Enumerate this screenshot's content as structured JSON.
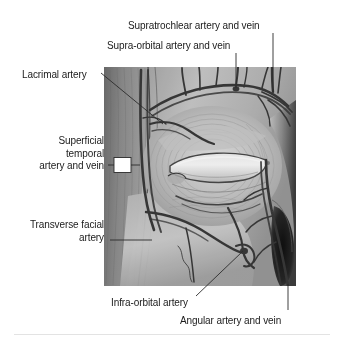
{
  "figure": {
    "view": "right lateral-oblique facial dissection",
    "style": "monochrome airbrush / wash medical illustration",
    "background_color": "#ffffff",
    "vessel_color": "#3a3a3a",
    "leader_color": "#2b2b2b",
    "text_color": "#1b1b1b",
    "image_bounds": {
      "left": 104,
      "top": 67,
      "right": 296,
      "bottom": 286
    }
  },
  "labels": [
    {
      "id": "supratrochlear",
      "text": "Supratrochlear artery and vein",
      "x": 128,
      "y": 20,
      "align": "left",
      "leader": {
        "type": "vertical",
        "from_x": 273,
        "from_y": 33,
        "to_x": 273,
        "to_y": 92
      }
    },
    {
      "id": "supra-orbital",
      "text": "Supra-orbital artery and vein",
      "x": 107,
      "y": 40,
      "align": "left",
      "leader": {
        "type": "vertical",
        "from_x": 236,
        "from_y": 53,
        "to_x": 236,
        "to_y": 88
      }
    },
    {
      "id": "lacrimal",
      "text": "Lacrimal artery",
      "x": 22,
      "y": 69,
      "align": "left",
      "leader": {
        "type": "diagonal",
        "from_x": 101,
        "from_y": 73,
        "to_x": 163,
        "to_y": 124
      }
    },
    {
      "id": "superficial-temporal",
      "text": "Superficial\ntemporal\nartery and vein",
      "x": 33,
      "y": 135,
      "align": "right",
      "leader": {
        "type": "box",
        "line_from_x": 108,
        "line_from_y": 165,
        "line_to_x": 114,
        "line_to_y": 165,
        "box_x": 114,
        "box_y": 157,
        "box_w": 17,
        "box_h": 15,
        "tail_to_x": 139,
        "tail_to_y": 165
      }
    },
    {
      "id": "transverse-facial",
      "text": "Transverse facial\nartery",
      "x": 17,
      "y": 219,
      "align": "right",
      "leader": {
        "type": "horizontal",
        "from_x": 110,
        "from_y": 240,
        "to_x": 152,
        "to_y": 240
      }
    },
    {
      "id": "infra-orbital",
      "text": "Infra-orbital artery",
      "x": 111,
      "y": 297,
      "align": "left",
      "leader": {
        "type": "diagonal",
        "from_x": 196,
        "from_y": 296,
        "to_x": 243,
        "to_y": 251
      }
    },
    {
      "id": "angular",
      "text": "Angular artery and vein",
      "x": 180,
      "y": 315,
      "align": "left",
      "leader": {
        "type": "vertical",
        "from_x": 288,
        "from_y": 310,
        "to_x": 288,
        "to_y": 284
      }
    }
  ],
  "anatomy": {
    "regions": [
      {
        "name": "temporal-region",
        "note": "upper left of illustration, vertical muscle fibres and fascia"
      },
      {
        "name": "orbit-and-eyelids",
        "note": "central, palpebral fissure with upper and lower lids"
      },
      {
        "name": "orbicularis-oculi",
        "note": "concentric fibres encircling the orbital opening"
      },
      {
        "name": "cheek-zygomatic",
        "note": "lower left, smooth wash with transverse facial vessels"
      },
      {
        "name": "nasal-ala-and-nostril",
        "note": "dark right margin showing nostril aperture"
      }
    ],
    "vessels": [
      "supratrochlear artery and vein",
      "supra-orbital artery and vein",
      "lacrimal artery",
      "superficial temporal artery and vein",
      "transverse facial artery",
      "infra-orbital artery",
      "angular artery and vein"
    ]
  }
}
